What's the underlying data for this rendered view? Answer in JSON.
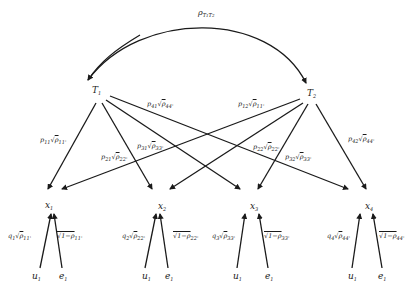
{
  "diagram": {
    "type": "path-diagram",
    "correlation_label": "ρT1T2",
    "latent_nodes": [
      {
        "id": "T1",
        "label": "T",
        "sub": "1"
      },
      {
        "id": "T2",
        "label": "T",
        "sub": "2"
      }
    ],
    "observed_nodes": [
      {
        "id": "x1",
        "label": "x",
        "sub": "1"
      },
      {
        "id": "x2",
        "label": "x",
        "sub": "2"
      },
      {
        "id": "x3",
        "label": "x",
        "sub": "3"
      },
      {
        "id": "x4",
        "label": "x",
        "sub": "4"
      }
    ],
    "latent_paths": [
      {
        "from": "T1",
        "to": "x1",
        "p": "p",
        "psub": "11",
        "rho": "ρ",
        "rsub": "11'"
      },
      {
        "from": "T1",
        "to": "x2",
        "p": "p",
        "psub": "21",
        "rho": "ρ",
        "rsub": "22'"
      },
      {
        "from": "T1",
        "to": "x3",
        "p": "p",
        "psub": "31",
        "rho": "ρ",
        "rsub": "33'"
      },
      {
        "from": "T1",
        "to": "x4",
        "p": "p",
        "psub": "41",
        "rho": "ρ",
        "rsub": "44'"
      },
      {
        "from": "T2",
        "to": "x1",
        "p": "p",
        "psub": "12",
        "rho": "ρ",
        "rsub": "11'"
      },
      {
        "from": "T2",
        "to": "x2",
        "p": "p",
        "psub": "22",
        "rho": "ρ",
        "rsub": "22'"
      },
      {
        "from": "T2",
        "to": "x3",
        "p": "p",
        "psub": "32",
        "rho": "ρ",
        "rsub": "33'"
      },
      {
        "from": "T2",
        "to": "x4",
        "p": "p",
        "psub": "42",
        "rho": "ρ",
        "rsub": "44'"
      }
    ],
    "error_groups": [
      {
        "x": "x1",
        "u_label": "u",
        "u_sub": "1",
        "e_label": "e",
        "e_sub": "1",
        "q": "q",
        "qsub": "1",
        "rsub": "11'",
        "err": "√1−ρ",
        "err_sub": "11'"
      },
      {
        "x": "x2",
        "u_label": "u",
        "u_sub": "1",
        "e_label": "e",
        "e_sub": "1",
        "q": "q",
        "qsub": "2",
        "rsub": "22'",
        "err": "√1−ρ",
        "err_sub": "22'"
      },
      {
        "x": "x3",
        "u_label": "u",
        "u_sub": "1",
        "e_label": "e",
        "e_sub": "1",
        "q": "q",
        "qsub": "3",
        "rsub": "33'",
        "err": "√1−ρ",
        "err_sub": "33'"
      },
      {
        "x": "x4",
        "u_label": "u",
        "u_sub": "1",
        "e_label": "e",
        "e_sub": "1",
        "q": "q",
        "qsub": "4",
        "rsub": "44'",
        "err": "√1−ρ",
        "err_sub": "44'"
      }
    ],
    "labels": {
      "rho": "ρ",
      "T": "T",
      "sub1": "1",
      "sub2": "2",
      "sqrt": "√",
      "sqrt_rho": "ρ",
      "one_minus": "1−ρ"
    }
  }
}
